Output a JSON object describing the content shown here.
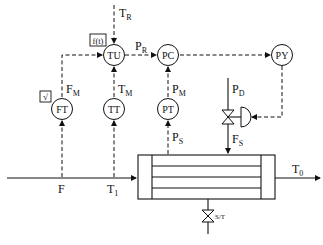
{
  "diagram": {
    "type": "process-control-schematic",
    "instruments": {
      "TU": "TU",
      "PC": "PC",
      "PY": "PY",
      "FT": "FT",
      "TT": "TT",
      "PT": "PT"
    },
    "signals": {
      "T_R": {
        "main": "T",
        "sub": "R"
      },
      "P_R": {
        "main": "P",
        "sub": "R"
      },
      "F_M": {
        "main": "F",
        "sub": "M"
      },
      "T_M": {
        "main": "T",
        "sub": "M"
      },
      "P_M": {
        "main": "P",
        "sub": "M"
      },
      "P_D": {
        "main": "P",
        "sub": "D"
      },
      "F_S": {
        "main": "F",
        "sub": "S"
      },
      "P_S": {
        "main": "P",
        "sub": "S"
      },
      "T_1": {
        "main": "T",
        "sub": "1"
      },
      "T_0": {
        "main": "T",
        "sub": "0"
      },
      "F": {
        "main": "F"
      }
    },
    "function_blocks": {
      "ft_block": "√",
      "tu_block": "f(t)"
    },
    "steam_trap_label": "S/T",
    "equipment": "shell-and-tube heat exchanger"
  }
}
